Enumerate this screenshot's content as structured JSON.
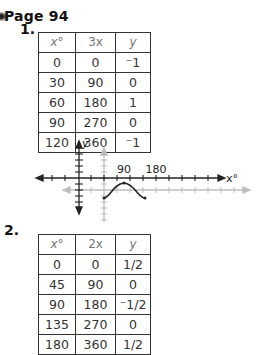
{
  "page": {
    "title": "Page 94"
  },
  "problems": [
    {
      "number": "1.",
      "table": {
        "headers": [
          "x°",
          "3x",
          "y"
        ],
        "rows": [
          [
            "0",
            "0",
            "⁻1"
          ],
          [
            "30",
            "90",
            "0"
          ],
          [
            "60",
            "180",
            "1"
          ],
          [
            "90",
            "270",
            "0"
          ],
          [
            "120",
            "360",
            "⁻1"
          ]
        ]
      },
      "graph": {
        "y_axis_label": "y",
        "x_axis_label": "x°",
        "tick_labels": [
          "90",
          "180"
        ]
      }
    },
    {
      "number": "2.",
      "table": {
        "headers": [
          "x°",
          "2x",
          "y"
        ],
        "rows": [
          [
            "0",
            "0",
            "1/2"
          ],
          [
            "45",
            "90",
            "0"
          ],
          [
            "90",
            "180",
            "⁻1/2"
          ],
          [
            "135",
            "270",
            "0"
          ],
          [
            "180",
            "360",
            "1/2"
          ]
        ]
      }
    }
  ],
  "colors": {
    "ink": "#222222",
    "gray_axis": "#b8b8b8"
  }
}
